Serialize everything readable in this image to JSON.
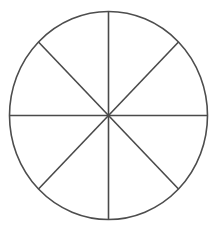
{
  "figure": {
    "name": "circle-divided-into-eighths",
    "background_color": "#ffffff",
    "canvas": {
      "width": 217,
      "height": 228
    }
  },
  "chart_data": {
    "type": "pie",
    "title": "",
    "subtitle": "",
    "xlabel": "",
    "ylabel": "",
    "legend_position": "none",
    "grid": false,
    "categories": [
      "sector-1",
      "sector-2",
      "sector-3",
      "sector-4",
      "sector-5",
      "sector-6",
      "sector-7",
      "sector-8"
    ],
    "values": [
      12.5,
      12.5,
      12.5,
      12.5,
      12.5,
      12.5,
      12.5,
      12.5
    ],
    "value_unit": "percent",
    "slice_fraction": "1/8",
    "slice_angle_degrees": 45,
    "total_slices": 8,
    "shaded_slices": 0,
    "slice_fill": "#ffffff",
    "slice_stroke": "#4d4d4d",
    "annotations": []
  },
  "geometry": {
    "center_x": 108.5,
    "center_y": 115.5,
    "radius_x": 99,
    "radius_y": 104,
    "outline_color": "#4d4d4d",
    "outline_width": 1.6,
    "divider_color": "#4a4a4a",
    "divider_width": 1.6,
    "dividers": [
      {
        "name": "vertical-diameter",
        "angle_degrees": 90
      },
      {
        "name": "horizontal-diameter",
        "angle_degrees": 0
      },
      {
        "name": "diagonal-diameter-nw-se",
        "angle_degrees": 135
      },
      {
        "name": "diagonal-diameter-ne-sw",
        "angle_degrees": 45
      }
    ]
  }
}
